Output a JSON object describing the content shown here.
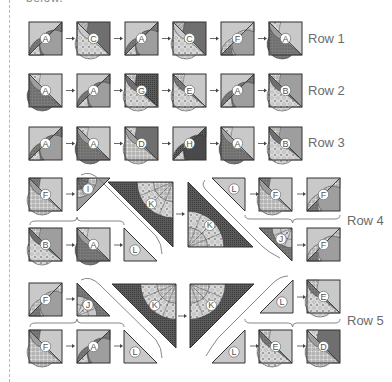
{
  "header": {
    "partial_text": "below."
  },
  "colors": {
    "light": "#c9c9c9",
    "mid": "#9e9e9e",
    "dark": "#6f6f6f",
    "darker": "#4a4a4a",
    "outline": "#333333",
    "label": "#6b6b6b",
    "bracket": "#7a7a7a"
  },
  "rows": [
    {
      "label": "Row 1",
      "blocks": [
        "A",
        "C",
        "A",
        "C",
        "F",
        "A"
      ]
    },
    {
      "label": "Row 2",
      "blocks": [
        "A",
        "A",
        "G",
        "E",
        "A",
        "B"
      ]
    },
    {
      "label": "Row 3",
      "blocks": [
        "A",
        "A",
        "D",
        "H",
        "A",
        "B"
      ]
    }
  ],
  "row4": {
    "label": "Row 4",
    "left_top": [
      "F",
      "I"
    ],
    "left_bottom": [
      "B",
      "A",
      "L"
    ],
    "center": [
      "K",
      "K"
    ],
    "right_top": [
      "L",
      "F",
      "F"
    ],
    "right_bottom": [
      "J",
      "F"
    ]
  },
  "row5": {
    "label": "Row 5",
    "left_top": [
      "F",
      "J"
    ],
    "left_bottom": [
      "F",
      "A",
      "L"
    ],
    "center": [
      "K",
      "K"
    ],
    "right_top": [
      "L",
      "E"
    ],
    "right_bottom": [
      "L",
      "E",
      "D"
    ]
  }
}
